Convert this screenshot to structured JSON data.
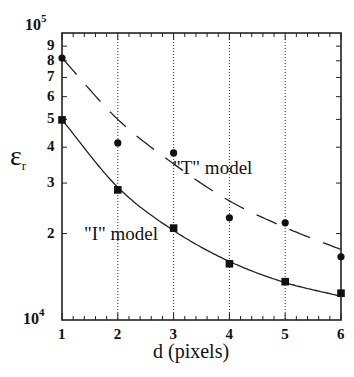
{
  "chart_data": {
    "type": "scatter",
    "title": "",
    "xlabel": "d (pixels)",
    "ylabel": "ε_r",
    "x": [
      1,
      2,
      3,
      4,
      5,
      6
    ],
    "xlim": [
      1,
      6
    ],
    "ylim": [
      10000,
      100000
    ],
    "yscale": "log",
    "grid": "vertical dotted lines at x = 2, 3, 4, 5",
    "x_ticks": [
      "1",
      "2",
      "3",
      "4",
      "5",
      "6"
    ],
    "y_ticks": [
      "10^4",
      "2",
      "3",
      "4",
      "5",
      "6",
      "7",
      "8",
      "9",
      "10^5"
    ],
    "series": [
      {
        "name": "\"T\" model",
        "marker": "circle",
        "values": [
          81800,
          41400,
          38200,
          22700,
          21800,
          16600
        ],
        "fit_line": "dashed",
        "fit_values": [
          81800,
          50000,
          35000,
          26000,
          21000,
          17600
        ]
      },
      {
        "name": "\"I\" model",
        "marker": "square",
        "values": [
          49800,
          28400,
          20900,
          15700,
          13600,
          12400
        ],
        "fit_line": "solid",
        "fit_values": [
          49800,
          29000,
          20500,
          16000,
          13500,
          12100
        ]
      }
    ],
    "annotations": [
      "\"T\" model",
      "\"I\" model"
    ]
  },
  "labels": {
    "y_top_base": "10",
    "y_top_exp": "5",
    "y_bottom_base": "10",
    "y_bottom_exp": "4",
    "y_minor": [
      "9",
      "8",
      "7",
      "6",
      "5",
      "4",
      "3",
      "2"
    ],
    "x_ticks": [
      "1",
      "2",
      "3",
      "4",
      "5",
      "6"
    ],
    "xlabel": "d (pixels)",
    "ylabel_main": "ε",
    "ylabel_sub": "r",
    "t_model": "\"T\" model",
    "i_model": "\"I\" model"
  }
}
